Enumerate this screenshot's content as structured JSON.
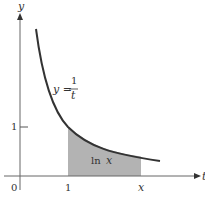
{
  "figure": {
    "axes": {
      "x_label": "t",
      "y_label": "y",
      "origin_label": "0",
      "x_ticks": [
        {
          "value": 1,
          "label": "1"
        },
        {
          "value": "x",
          "label": "x"
        }
      ],
      "y_ticks": [
        {
          "value": 1,
          "label": "1"
        }
      ]
    },
    "curve": {
      "equation_lhs": "y =",
      "fraction_num": "1",
      "fraction_den": "t",
      "color": "#333333"
    },
    "shaded_region": {
      "label_fn": "ln",
      "label_var": "x",
      "from": 1,
      "to": "x",
      "color": "#b3b3b3"
    }
  }
}
